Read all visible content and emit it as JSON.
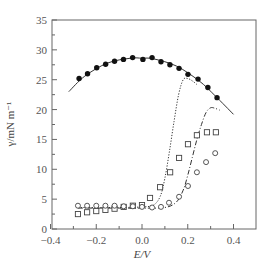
{
  "chart_data": {
    "type": "scatter",
    "title": "",
    "xlabel": "E/V",
    "ylabel": "γ/mN m⁻¹",
    "xlim": [
      -0.4,
      0.5
    ],
    "ylim": [
      0,
      35
    ],
    "xticks": [
      -0.4,
      -0.2,
      0.0,
      0.2,
      0.4
    ],
    "xtick_labels": [
      "−0.4",
      "−0.2",
      "0.0",
      "0.2",
      "0.4"
    ],
    "yticks": [
      0,
      5,
      10,
      15,
      20,
      25,
      30,
      35
    ],
    "ytick_labels": [
      "0",
      "5",
      "10",
      "15",
      "20",
      "25",
      "30",
      "35"
    ],
    "grid": false,
    "legend": null,
    "series": [
      {
        "name": "filled circles",
        "marker": "filled-circle",
        "x": [
          -0.275,
          -0.238,
          -0.198,
          -0.159,
          -0.12,
          -0.081,
          -0.041,
          0.004,
          0.044,
          0.083,
          0.122,
          0.162,
          0.201,
          0.245,
          0.288,
          0.328
        ],
        "y": [
          25.2,
          26.0,
          27.0,
          27.6,
          28.1,
          28.4,
          28.7,
          28.4,
          28.7,
          28.0,
          27.5,
          26.9,
          25.9,
          25.1,
          23.7,
          22.0
        ]
      },
      {
        "name": "fit curve (solid)",
        "line": "solid",
        "x": [
          -0.32,
          -0.25,
          -0.15,
          -0.05,
          0.0,
          0.05,
          0.15,
          0.25,
          0.32,
          0.4
        ],
        "y": [
          23.0,
          25.6,
          27.8,
          28.6,
          28.6,
          28.5,
          27.3,
          24.8,
          22.3,
          19.2
        ]
      },
      {
        "name": "open squares",
        "marker": "open-square",
        "x": [
          -0.28,
          -0.24,
          -0.2,
          -0.16,
          -0.12,
          -0.08,
          -0.04,
          0.0,
          0.035,
          0.079,
          0.123,
          0.162,
          0.201,
          0.24,
          0.284,
          0.323
        ],
        "y": [
          2.5,
          2.8,
          3.0,
          3.2,
          3.4,
          3.7,
          3.9,
          4.0,
          5.2,
          7.0,
          9.5,
          11.9,
          14.2,
          15.7,
          16.2,
          16.2
        ]
      },
      {
        "name": "open circles",
        "marker": "open-circle",
        "x": [
          -0.28,
          -0.24,
          -0.2,
          -0.16,
          -0.12,
          -0.08,
          -0.04,
          0.0,
          0.044,
          0.083,
          0.118,
          0.162,
          0.201,
          0.24,
          0.28,
          0.32
        ],
        "y": [
          3.9,
          3.9,
          3.9,
          3.9,
          3.9,
          3.8,
          3.8,
          3.7,
          3.6,
          3.7,
          4.4,
          5.4,
          7.2,
          9.5,
          11.2,
          12.7
        ]
      },
      {
        "name": "dotted curve",
        "line": "dotted",
        "x": [
          -0.28,
          -0.1,
          0.0,
          0.05,
          0.08,
          0.1,
          0.12,
          0.14,
          0.16,
          0.18,
          0.2,
          0.22,
          0.24
        ],
        "y": [
          3.6,
          3.6,
          3.7,
          4.0,
          5.5,
          8.5,
          13.0,
          18.0,
          22.5,
          25.0,
          25.2,
          24.8,
          24.2
        ]
      },
      {
        "name": "dash-dot curve",
        "line": "dash-dot",
        "x": [
          -0.28,
          -0.1,
          0.0,
          0.1,
          0.15,
          0.18,
          0.2,
          0.22,
          0.24,
          0.26,
          0.28,
          0.3,
          0.32,
          0.34
        ],
        "y": [
          3.5,
          3.5,
          3.5,
          3.6,
          4.5,
          6.5,
          9.0,
          12.0,
          15.0,
          17.5,
          19.5,
          20.3,
          20.2,
          19.9
        ]
      }
    ]
  }
}
